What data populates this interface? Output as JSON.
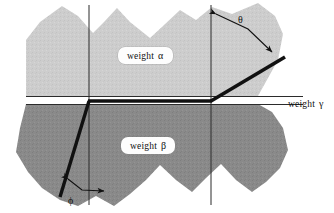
{
  "figure": {
    "type": "grain-boundary-diagram",
    "background_color": "#ffffff",
    "labels": {
      "alpha": "weight",
      "alpha_symbol": "α",
      "beta": "weight",
      "beta_symbol": "β",
      "gamma": "weight",
      "gamma_symbol": "γ",
      "theta_symbol": "θ",
      "phi_symbol": "ϕ"
    },
    "regions": [
      {
        "name": "upper-grain",
        "weight": "α",
        "fill": "#cdcdcd",
        "description": "light gray jagged polygon above the horizontal interface"
      },
      {
        "name": "lower-grain",
        "weight": "β",
        "fill": "#8a8a8a",
        "description": "dark gray jagged polygon below the horizontal interface"
      },
      {
        "name": "interface-strip",
        "weight": "γ",
        "fill": "#ffffff",
        "description": "thin horizontal band separating the two grains"
      }
    ],
    "angles": [
      {
        "name": "theta",
        "symbol": "θ",
        "at": "upper-right vertical reference line",
        "arrow": "double-headed bent arrow"
      },
      {
        "name": "phi",
        "symbol": "ϕ",
        "at": "lower-left vertical reference line",
        "arrow": "double-headed bent arrow"
      }
    ],
    "colors": {
      "upper_fill": "#cdcdcd",
      "lower_fill": "#8a8a8a",
      "line": "#111111",
      "thin_line": "#2b2b2b",
      "label_box": "#fdfdfd"
    },
    "reference_lines": [
      {
        "name": "left-vertical",
        "x": 89
      },
      {
        "name": "right-vertical",
        "x": 211
      },
      {
        "name": "upper-horizontal",
        "y": 96
      },
      {
        "name": "lower-horizontal",
        "y": 104
      }
    ]
  }
}
